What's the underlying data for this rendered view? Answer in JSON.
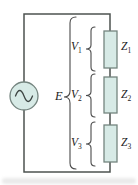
{
  "figure": {
    "kind": "series-ac-circuit-diagram"
  },
  "colors": {
    "wire": "#4d5350",
    "component_fill": "#d7eae6",
    "component_stroke": "#74847f",
    "symbol": "#3d4543",
    "brace": "#4a4a4a",
    "text": "#1c1c1c",
    "background": "#ffffff"
  },
  "source": {
    "icon": "sine-wave",
    "type": "ac-voltage-source"
  },
  "labels": {
    "source_total": {
      "base": "E",
      "sub": ""
    },
    "voltages": [
      {
        "base": "V",
        "sub": "1"
      },
      {
        "base": "V",
        "sub": "2"
      },
      {
        "base": "V",
        "sub": "3"
      }
    ],
    "impedances": [
      {
        "base": "Z",
        "sub": "1"
      },
      {
        "base": "Z",
        "sub": "2"
      },
      {
        "base": "Z",
        "sub": "3"
      }
    ]
  }
}
